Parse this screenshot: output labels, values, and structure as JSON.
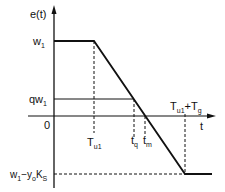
{
  "diagram": {
    "y_axis_label": "e(t)",
    "x_axis_label": "t",
    "y_ticks": {
      "w1": {
        "main": "w",
        "sub": "1"
      },
      "qw1": {
        "main": "qw",
        "sub": "1"
      },
      "zero": "0",
      "bottom": {
        "p1": "w",
        "s1": "1",
        "p2": "−y",
        "s2": "o",
        "p3": "K",
        "s3": "S"
      }
    },
    "x_ticks": {
      "Tu1": {
        "main": "T",
        "sub": "u1"
      },
      "tq": {
        "main": "t",
        "sub": "q"
      },
      "tm": {
        "main": "t",
        "sub": "m"
      },
      "Tu1_Tg": {
        "main1": "T",
        "sub1": "u1",
        "plus": "+",
        "main2": "T",
        "sub2": "g"
      }
    }
  }
}
